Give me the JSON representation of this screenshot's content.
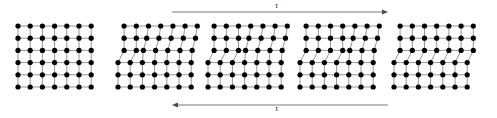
{
  "figure": {
    "background_color": "#ffffff",
    "atom_color": "#000000",
    "bond_color": "#8a8a8a",
    "arrow_color": "#7a7a7a",
    "width": 497,
    "height": 118
  },
  "annotations": {
    "shear_top_label": "τ",
    "shear_bottom_label": "τ",
    "shear_top_direction": "right",
    "shear_bottom_direction": "left"
  },
  "arrows": {
    "top": {
      "x1": 172,
      "x2": 388,
      "y": 12,
      "direction": "right"
    },
    "bottom": {
      "x1": 388,
      "x2": 172,
      "y": 105,
      "direction": "left"
    }
  },
  "lattice_geometry": {
    "spacing_x": 12.2,
    "spacing_y": 12.2,
    "atom_radius": 2.6,
    "rows": 6,
    "cols": 7,
    "origin_y": 26
  },
  "chart_data": {
    "type": "diagram",
    "stage_count": 5,
    "stages": [
      {
        "index": 1,
        "name": "perfect-lattice",
        "label": "perfect crystal before slip",
        "origin_x": 18,
        "top_rows": 3,
        "bottom_rows": 3,
        "top_cols": 7,
        "bottom_cols": 7,
        "top_offset_cols": 0,
        "bottom_offset_cols": 0,
        "core_col": null,
        "has_dislocation": false,
        "step_side": null
      },
      {
        "index": 2,
        "name": "dislocation-entered-left",
        "label": "extra half-plane near left surface",
        "origin_x": 118,
        "top_rows": 3,
        "bottom_rows": 3,
        "top_cols": 7,
        "bottom_cols": 7,
        "top_offset_cols": 0.5,
        "bottom_offset_cols": 0,
        "core_col": 1.5,
        "has_dislocation": true,
        "step_side": "left"
      },
      {
        "index": 3,
        "name": "dislocation-mid-left",
        "label": "dislocation glided one step right",
        "origin_x": 208,
        "top_rows": 3,
        "bottom_rows": 3,
        "top_cols": 7,
        "bottom_cols": 7,
        "top_offset_cols": 0.5,
        "bottom_offset_cols": 0,
        "core_col": 2.5,
        "has_dislocation": true,
        "step_side": "left"
      },
      {
        "index": 4,
        "name": "dislocation-mid-right",
        "label": "dislocation glided further right",
        "origin_x": 300,
        "top_rows": 3,
        "bottom_rows": 3,
        "top_cols": 7,
        "bottom_cols": 7,
        "top_offset_cols": 0.5,
        "bottom_offset_cols": 0,
        "core_col": 4.0,
        "has_dislocation": true,
        "step_side": "left"
      },
      {
        "index": 5,
        "name": "dislocation-exited-step",
        "label": "dislocation exits leaving slip step",
        "origin_x": 394,
        "top_rows": 3,
        "bottom_rows": 3,
        "top_cols": 7,
        "bottom_cols": 7,
        "top_offset_cols": 0.5,
        "bottom_offset_cols": 0,
        "core_col": 6.5,
        "has_dislocation": false,
        "step_side": "both"
      }
    ],
    "axis_labels": {
      "xlabel": "",
      "ylabel": ""
    },
    "legend": [],
    "grid": false
  }
}
